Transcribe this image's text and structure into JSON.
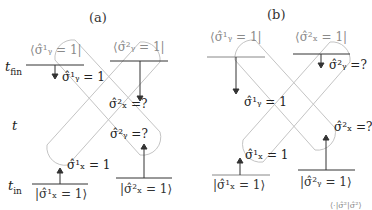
{
  "panels": [
    {
      "id": "a",
      "label": "(a)",
      "bras": [
        "⟨σ̂¹ᵧ = 1|",
        "⟨σ̂²ᵧ = 1|"
      ],
      "kets": [
        "|σ̂¹ₓ = 1⟩",
        "|σ̂²ₓ = 1⟩"
      ],
      "observables": [
        "σ̂¹ᵧ = 1",
        "σ̂²ₓ =?",
        "σ̂²ᵧ =?",
        "σ̂¹ₓ = 1"
      ]
    },
    {
      "id": "b",
      "label": "(b)",
      "bras": [
        "⟨σ̂¹ᵧ = 1|",
        "⟨σ̂²ₓ = 1|"
      ],
      "kets": [
        "|σ̂¹ₓ = 1⟩",
        "|σ̂²ᵧ = 1⟩"
      ],
      "observables": [
        "σ̂²ᵧ =?",
        "σ̂¹ᵧ = 1",
        "σ̂²ₓ =?",
        "σ̂¹ₓ = 1"
      ]
    }
  ],
  "time_axis": {
    "t_fin": "fin",
    "t": "t",
    "t_in": "in"
  },
  "footer_fragment": "⟨·|σ̂²|σ̂²⟩",
  "colors": {
    "worldline": "#bdbdbd",
    "bra_text": "#8a8a8a",
    "line": "#333333"
  }
}
